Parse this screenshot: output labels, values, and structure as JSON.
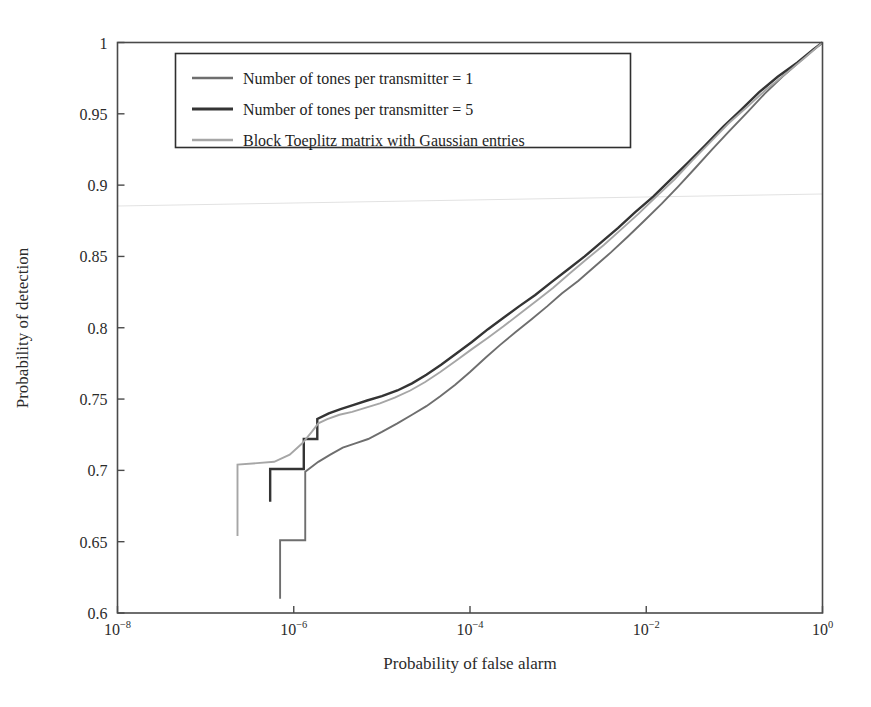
{
  "figure": {
    "background": "#ffffff",
    "frame_color": "#4a4a4a",
    "artifact_line_color": "#e2e2e2"
  },
  "axes": {
    "xlabel": "Probability of false alarm",
    "ylabel": "Probability of detection",
    "x_tick_labels": [
      "10-8",
      "10-6",
      "10-4",
      "10-2",
      "100"
    ],
    "x_tick_mantissas": [
      "10",
      "10",
      "10",
      "10",
      "10"
    ],
    "x_tick_exponents": [
      "−8",
      "−6",
      "−4",
      "−2",
      "0"
    ],
    "y_tick_labels": [
      "0.6",
      "0.65",
      "0.7",
      "0.75",
      "0.8",
      "0.85",
      "0.9",
      "0.95",
      "1"
    ]
  },
  "legend": {
    "position": "upper-left-inside",
    "entries": [
      {
        "label": "Number of tones per transmitter = 1",
        "color": "#6e6e6e",
        "width": 1.9
      },
      {
        "label": "Number of tones per transmitter = 5",
        "color": "#343434",
        "width": 2.4
      },
      {
        "label": "Block Toeplitz matrix with Gaussian entries",
        "color": "#a6a6a6",
        "width": 1.9
      }
    ]
  },
  "chart_data": {
    "type": "line",
    "title": "",
    "xlabel": "Probability of false alarm",
    "ylabel": "Probability of detection",
    "xscale": "log",
    "yscale": "linear",
    "xlim": [
      1e-08,
      1
    ],
    "ylim": [
      0.6,
      1.0
    ],
    "xticks": [
      1e-08,
      1e-06,
      0.0001,
      0.01,
      1
    ],
    "yticks": [
      0.6,
      0.65,
      0.7,
      0.75,
      0.8,
      0.85,
      0.9,
      0.95,
      1.0
    ],
    "grid": false,
    "legend_position": "upper left",
    "series": [
      {
        "name": "Number of tones per transmitter = 1",
        "color": "#6e6e6e",
        "points": [
          [
            7e-07,
            0.61
          ],
          [
            7e-07,
            0.651
          ],
          [
            1.35e-06,
            0.651
          ],
          [
            1.35e-06,
            0.699
          ],
          [
            1.9e-06,
            0.706
          ],
          [
            2.6e-06,
            0.711
          ],
          [
            3.6e-06,
            0.716
          ],
          [
            5e-06,
            0.719
          ],
          [
            7e-06,
            0.722
          ],
          [
            1e-05,
            0.727
          ],
          [
            1.5e-05,
            0.733
          ],
          [
            2.2e-05,
            0.739
          ],
          [
            3.2e-05,
            0.745
          ],
          [
            4.6e-05,
            0.752
          ],
          [
            6.8e-05,
            0.76
          ],
          [
            0.0001,
            0.769
          ],
          [
            0.00015,
            0.779
          ],
          [
            0.00022,
            0.788
          ],
          [
            0.00033,
            0.797
          ],
          [
            0.0005,
            0.806
          ],
          [
            0.00075,
            0.815
          ],
          [
            0.0011,
            0.824
          ],
          [
            0.0017,
            0.833
          ],
          [
            0.0026,
            0.843
          ],
          [
            0.004,
            0.853
          ],
          [
            0.0062,
            0.864
          ],
          [
            0.0095,
            0.875
          ],
          [
            0.015,
            0.887
          ],
          [
            0.023,
            0.899
          ],
          [
            0.036,
            0.912
          ],
          [
            0.056,
            0.925
          ],
          [
            0.088,
            0.938
          ],
          [
            0.14,
            0.951
          ],
          [
            0.22,
            0.964
          ],
          [
            0.35,
            0.976
          ],
          [
            0.56,
            0.987
          ],
          [
            0.8,
            0.995
          ],
          [
            1.0,
            1.0
          ]
        ]
      },
      {
        "name": "Number of tones per transmitter = 5",
        "color": "#343434",
        "points": [
          [
            5.4e-07,
            0.678
          ],
          [
            5.4e-07,
            0.701
          ],
          [
            1.3e-06,
            0.701
          ],
          [
            1.3e-06,
            0.722
          ],
          [
            1.85e-06,
            0.722
          ],
          [
            1.85e-06,
            0.736
          ],
          [
            2.5e-06,
            0.74
          ],
          [
            3.4e-06,
            0.743
          ],
          [
            4.8e-06,
            0.746
          ],
          [
            6.8e-06,
            0.749
          ],
          [
            1e-05,
            0.752
          ],
          [
            1.5e-05,
            0.756
          ],
          [
            2.2e-05,
            0.761
          ],
          [
            3.2e-05,
            0.767
          ],
          [
            4.7e-05,
            0.774
          ],
          [
            7e-05,
            0.782
          ],
          [
            0.000105,
            0.79
          ],
          [
            0.00016,
            0.799
          ],
          [
            0.00024,
            0.807
          ],
          [
            0.00036,
            0.815
          ],
          [
            0.00055,
            0.823
          ],
          [
            0.00084,
            0.832
          ],
          [
            0.0013,
            0.841
          ],
          [
            0.002,
            0.85
          ],
          [
            0.0031,
            0.86
          ],
          [
            0.0048,
            0.87
          ],
          [
            0.0075,
            0.881
          ],
          [
            0.012,
            0.892
          ],
          [
            0.019,
            0.904
          ],
          [
            0.03,
            0.916
          ],
          [
            0.047,
            0.928
          ],
          [
            0.075,
            0.941
          ],
          [
            0.12,
            0.953
          ],
          [
            0.19,
            0.965
          ],
          [
            0.31,
            0.976
          ],
          [
            0.52,
            0.986
          ],
          [
            0.78,
            0.995
          ],
          [
            1.0,
            1.0
          ]
        ]
      },
      {
        "name": "Block Toeplitz matrix with Gaussian entries",
        "color": "#a6a6a6",
        "points": [
          [
            2.3e-07,
            0.654
          ],
          [
            2.3e-07,
            0.704
          ],
          [
            6e-07,
            0.706
          ],
          [
            9e-07,
            0.711
          ],
          [
            1.25e-06,
            0.719
          ],
          [
            1.6e-06,
            0.727
          ],
          [
            1.9e-06,
            0.733
          ],
          [
            2.4e-06,
            0.736
          ],
          [
            3.3e-06,
            0.739
          ],
          [
            4.6e-06,
            0.741
          ],
          [
            6.6e-06,
            0.744
          ],
          [
            9.5e-06,
            0.747
          ],
          [
            1.4e-05,
            0.751
          ],
          [
            2.1e-05,
            0.756
          ],
          [
            3.1e-05,
            0.762
          ],
          [
            4.6e-05,
            0.769
          ],
          [
            7e-05,
            0.777
          ],
          [
            0.000105,
            0.785
          ],
          [
            0.00016,
            0.793
          ],
          [
            0.00024,
            0.801
          ],
          [
            0.00037,
            0.81
          ],
          [
            0.00057,
            0.819
          ],
          [
            0.00088,
            0.828
          ],
          [
            0.00135,
            0.838
          ],
          [
            0.0021,
            0.848
          ],
          [
            0.0033,
            0.858
          ],
          [
            0.0052,
            0.869
          ],
          [
            0.0082,
            0.88
          ],
          [
            0.013,
            0.892
          ],
          [
            0.021,
            0.904
          ],
          [
            0.033,
            0.917
          ],
          [
            0.053,
            0.93
          ],
          [
            0.085,
            0.943
          ],
          [
            0.14,
            0.955
          ],
          [
            0.23,
            0.967
          ],
          [
            0.38,
            0.978
          ],
          [
            0.62,
            0.989
          ],
          [
            1.0,
            1.0
          ]
        ]
      }
    ]
  }
}
